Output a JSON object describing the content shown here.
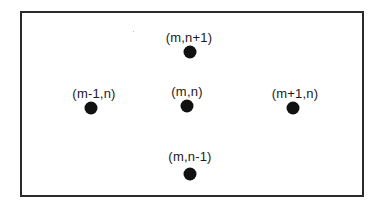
{
  "diagram": {
    "type": "grid-neighborhood",
    "points": [
      {
        "id": "north",
        "label": "(m,n+1)",
        "label_x": 189,
        "label_y": 37,
        "x": 190,
        "y": 52
      },
      {
        "id": "west",
        "label": "(m-1,n)",
        "label_x": 94,
        "label_y": 93,
        "x": 91,
        "y": 108
      },
      {
        "id": "center",
        "label": "(m,n)",
        "label_x": 187,
        "label_y": 91,
        "x": 187,
        "y": 106
      },
      {
        "id": "east",
        "label": "(m+1,n)",
        "label_x": 295,
        "label_y": 93,
        "x": 293,
        "y": 108
      },
      {
        "id": "south",
        "label": "(m,n-1)",
        "label_x": 190,
        "label_y": 156,
        "x": 190,
        "y": 174
      }
    ],
    "colors": {
      "dot": "#111111",
      "text": "#1a1a1a",
      "border": "#2a2a2a",
      "background": "#ffffff"
    }
  }
}
